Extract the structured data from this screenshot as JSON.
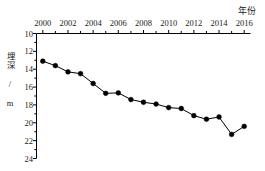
{
  "chart_data": {
    "type": "line",
    "title": "",
    "xlabel": "年份",
    "ylabel": "埋深 / m",
    "x": [
      2000,
      2001,
      2002,
      2003,
      2004,
      2005,
      2006,
      2007,
      2008,
      2009,
      2010,
      2011,
      2012,
      2013,
      2014,
      2015,
      2016
    ],
    "values": [
      13.1,
      13.6,
      14.3,
      14.5,
      15.6,
      16.7,
      16.65,
      17.4,
      17.7,
      17.9,
      18.3,
      18.4,
      19.2,
      19.6,
      19.35,
      21.3,
      20.4
    ],
    "xticks": [
      2000,
      2002,
      2004,
      2006,
      2008,
      2010,
      2012,
      2014,
      2016
    ],
    "xtick_labels": [
      "2000",
      "2002",
      "2004",
      "2006",
      "2008",
      "2010",
      "2012",
      "2014",
      "2016"
    ],
    "yticks": [
      10,
      12,
      14,
      16,
      18,
      20,
      22,
      24
    ],
    "ytick_labels": [
      "10",
      "12",
      "14",
      "16",
      "18",
      "20",
      "22",
      "24"
    ],
    "xlim": [
      1999.5,
      2016.5
    ],
    "ylim": [
      24,
      10
    ],
    "y_axis_inverted": true,
    "grid": false,
    "legend": false,
    "marker": "filled-circle",
    "line_color": "#000000",
    "marker_color": "#000000",
    "axis_color": "#000000",
    "background": "#ffffff",
    "x_axis_position": "top",
    "minor_xticks_every": 1
  }
}
